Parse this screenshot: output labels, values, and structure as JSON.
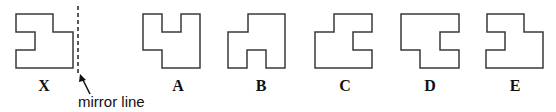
{
  "diagram": {
    "title": "",
    "mirror_label": "mirror line",
    "shapes": [
      {
        "id": "X",
        "label": "X",
        "label_x": 44,
        "points": "16,14 53,14 53,32 73,32 73,68 16,68 16,50 35,50 35,32 16,32"
      },
      {
        "id": "A",
        "label": "A",
        "label_x": 178,
        "points": "143,14 162,14 162,32 181,32 181,14 200,14 200,68 162,68 162,50 143,50"
      },
      {
        "id": "B",
        "label": "B",
        "label_x": 261,
        "points": "248,14 285,14 285,68 266,68 266,50 247,50 247,68 228,68 228,32 248,32"
      },
      {
        "id": "C",
        "label": "C",
        "label_x": 345,
        "points": "334,14 372,14 372,32 353,32 353,50 372,50 372,68 315,68 315,32 334,32"
      },
      {
        "id": "D",
        "label": "D",
        "label_x": 430,
        "points": "401,14 459,14 459,32 440,32 440,50 459,50 459,68 420,68 420,50 401,50"
      },
      {
        "id": "E",
        "label": "E",
        "label_x": 515,
        "points": "487,14 524,14 524,32 543,32 543,68 486,68 486,50 505,50 505,32 487,32"
      }
    ]
  }
}
